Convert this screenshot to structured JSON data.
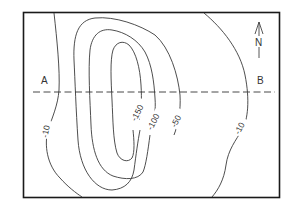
{
  "map": {
    "type": "contour-map",
    "section_line": {
      "start_label": "A",
      "end_label": "B"
    },
    "north_arrow": {
      "label": "N"
    },
    "contours": [
      {
        "value": "-10",
        "side": "west"
      },
      {
        "value": "-50",
        "side": "center"
      },
      {
        "value": "-100",
        "side": "center"
      },
      {
        "value": "-150",
        "side": "center"
      },
      {
        "value": "-10",
        "side": "east"
      }
    ]
  }
}
